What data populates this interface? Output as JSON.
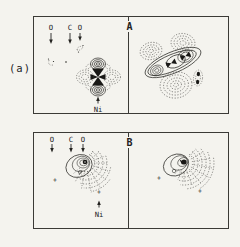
{
  "figure": {
    "label": "(a)",
    "plus_marker": "+",
    "panel_a": {
      "divider_label": "A",
      "atom_labels": [
        "O",
        "C",
        "O"
      ],
      "metal_label": "Ni"
    },
    "panel_b": {
      "divider_label": "B",
      "atom_labels": [
        "O",
        "C",
        "O"
      ],
      "metal_label": "Ni"
    }
  },
  "colors": {
    "ink": "#2b2a27",
    "paper": "#f4f3ee"
  }
}
